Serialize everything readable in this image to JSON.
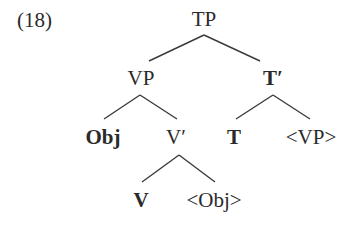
{
  "example_number": "(18)",
  "tree": {
    "root": "TP",
    "vp": "VP",
    "t_bar": "T′",
    "obj": "Obj",
    "v_bar": "V′",
    "t": "T",
    "vp_trace": "<VP>",
    "v": "V",
    "obj_trace": "<Obj>"
  },
  "style": {
    "line_color": "#3a3a3a",
    "text_color": "#2a2a2a"
  }
}
